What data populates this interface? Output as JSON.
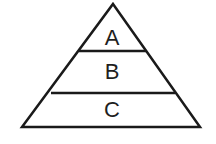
{
  "canvas": {
    "width": 216,
    "height": 144,
    "background_color": "#ffffff"
  },
  "diagram": {
    "type": "pyramid",
    "name": "three-tier-pyramid",
    "stroke_color": "#1a1a1a",
    "stroke_width": 2.5,
    "fill_color": "#ffffff",
    "text_color": "#1f1f1f",
    "outline": {
      "apex": {
        "x": 113,
        "y": 4
      },
      "bottom_left": {
        "x": 22,
        "y": 127
      },
      "bottom_right": {
        "x": 200,
        "y": 127
      },
      "points": "113,4 200,127 22,127"
    },
    "dividers": [
      {
        "name": "divider-a-b",
        "y": 51,
        "x1": 79,
        "x2": 146
      },
      {
        "name": "divider-b-c",
        "y": 93,
        "x1": 51,
        "x2": 175
      }
    ],
    "tiers": [
      {
        "id": "tier-a",
        "label": "A",
        "level": 1,
        "position": "top",
        "label_x": 112,
        "label_y": 39
      },
      {
        "id": "tier-b",
        "label": "B",
        "level": 2,
        "position": "middle",
        "label_x": 112,
        "label_y": 73
      },
      {
        "id": "tier-c",
        "label": "C",
        "level": 3,
        "position": "bottom",
        "label_x": 112,
        "label_y": 111
      }
    ]
  }
}
